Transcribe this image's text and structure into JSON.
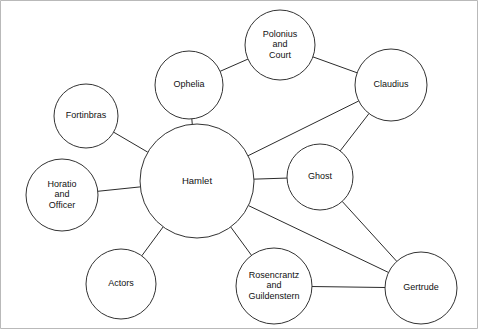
{
  "diagram": {
    "type": "node-link-network",
    "background_color": "#ffffff",
    "node_fill": "#ffffff",
    "node_stroke": "#333333",
    "edge_stroke": "#2b2b2b",
    "frame_stroke": "#b9b9b9",
    "nodes": [
      {
        "id": "polonius",
        "label_lines": [
          "Polonius",
          "and",
          "Court"
        ],
        "cx": 280,
        "cy": 45,
        "r": 35
      },
      {
        "id": "claudius",
        "label_lines": [
          "Claudius"
        ],
        "cx": 391,
        "cy": 85,
        "r": 36
      },
      {
        "id": "ophelia",
        "label_lines": [
          "Ophelia"
        ],
        "cx": 189,
        "cy": 85,
        "r": 34
      },
      {
        "id": "fortinbras",
        "label_lines": [
          "Fortinbras"
        ],
        "cx": 86,
        "cy": 116,
        "r": 32
      },
      {
        "id": "hamlet",
        "label_lines": [
          "Hamlet"
        ],
        "cx": 197,
        "cy": 181,
        "r": 57
      },
      {
        "id": "ghost",
        "label_lines": [
          "Ghost"
        ],
        "cx": 320,
        "cy": 177,
        "r": 33
      },
      {
        "id": "horatio",
        "label_lines": [
          "Horatio",
          "and",
          "Officer"
        ],
        "cx": 62,
        "cy": 195,
        "r": 36
      },
      {
        "id": "actors",
        "label_lines": [
          "Actors"
        ],
        "cx": 121,
        "cy": 284,
        "r": 35
      },
      {
        "id": "rosencrantz",
        "label_lines": [
          "Rosencrantz",
          "and",
          "Guildenstern"
        ],
        "cx": 274,
        "cy": 286,
        "r": 38
      },
      {
        "id": "gertrude",
        "label_lines": [
          "Gertrude"
        ],
        "cx": 421,
        "cy": 288,
        "r": 36
      }
    ],
    "edges": [
      {
        "id": "edge-ophelia-polonius",
        "source": "ophelia",
        "target": "polonius"
      },
      {
        "id": "edge-polonius-claudius",
        "source": "polonius",
        "target": "claudius"
      },
      {
        "id": "edge-claudius-hamlet",
        "source": "claudius",
        "target": "hamlet"
      },
      {
        "id": "edge-claudius-ghost",
        "source": "claudius",
        "target": "ghost"
      },
      {
        "id": "edge-ophelia-hamlet",
        "source": "ophelia",
        "target": "hamlet"
      },
      {
        "id": "edge-fortinbras-hamlet",
        "source": "fortinbras",
        "target": "hamlet"
      },
      {
        "id": "edge-horatio-hamlet",
        "source": "horatio",
        "target": "hamlet"
      },
      {
        "id": "edge-actors-hamlet",
        "source": "actors",
        "target": "hamlet"
      },
      {
        "id": "edge-hamlet-ghost",
        "source": "hamlet",
        "target": "ghost"
      },
      {
        "id": "edge-hamlet-rosencrantz",
        "source": "hamlet",
        "target": "rosencrantz"
      },
      {
        "id": "edge-hamlet-gertrude",
        "source": "hamlet",
        "target": "gertrude"
      },
      {
        "id": "edge-ghost-gertrude",
        "source": "ghost",
        "target": "gertrude"
      },
      {
        "id": "edge-rosencrantz-gertrude",
        "source": "rosencrantz",
        "target": "gertrude"
      }
    ]
  }
}
